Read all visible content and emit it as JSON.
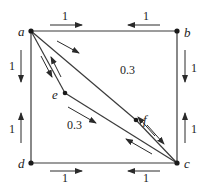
{
  "diagram": {
    "type": "flow-network",
    "nodes": [
      {
        "id": "a",
        "label": "a",
        "x": 31,
        "y": 31
      },
      {
        "id": "b",
        "label": "b",
        "x": 177,
        "y": 31
      },
      {
        "id": "c",
        "label": "c",
        "x": 177,
        "y": 163
      },
      {
        "id": "d",
        "label": "d",
        "x": 31,
        "y": 163
      },
      {
        "id": "e",
        "label": "e",
        "x": 65,
        "y": 93
      },
      {
        "id": "f",
        "label": "f",
        "x": 136,
        "y": 120
      }
    ],
    "edges": [
      {
        "from": "a",
        "to": "b"
      },
      {
        "from": "b",
        "to": "c"
      },
      {
        "from": "d",
        "to": "c"
      },
      {
        "from": "a",
        "to": "d"
      },
      {
        "from": "a",
        "to": "f"
      },
      {
        "from": "f",
        "to": "c"
      },
      {
        "from": "a",
        "to": "e"
      },
      {
        "from": "e",
        "to": "c"
      }
    ],
    "weights": {
      "ab_top": "1",
      "ab_top_right": "1",
      "ad_left": "1",
      "dc_left_lower": "1",
      "bc_right": "1",
      "bc_right_lower": "1",
      "dc_bottom": "1",
      "dc_bottom_right": "1",
      "af": "0.3",
      "ec": "0.3"
    }
  }
}
